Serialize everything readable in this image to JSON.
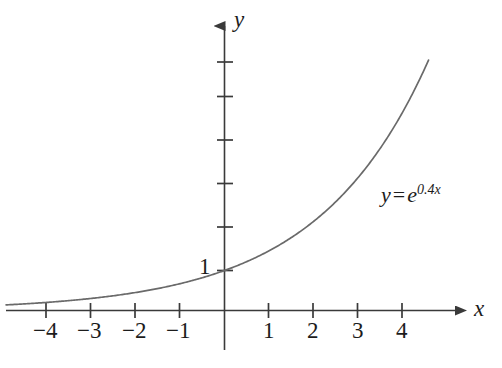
{
  "figure": {
    "background_color": "#ffffff",
    "axis_color": "#3a3a3a",
    "curve_color": "#6a6a6a",
    "text_color": "#1c1c1c"
  },
  "axes": {
    "x_axis_name": "x",
    "y_axis_name": "y",
    "y_axis_value_label": "1"
  },
  "equation": {
    "lhs": "y",
    "operator": "=",
    "base": "e",
    "exponent": "0.4x",
    "full_text": "y = e^(0.4x)"
  },
  "chart_data": {
    "type": "line",
    "title": "",
    "subtitle": "",
    "xlabel": "x",
    "ylabel": "y",
    "function": "y = e^(0.4x)",
    "legend": [
      "y = e^{0.4x}"
    ],
    "legend_position": "inline-right",
    "grid": false,
    "xlim": [
      -5.0,
      5.1
    ],
    "ylim": [
      -1.0,
      6.5
    ],
    "x_ticks": [
      -4,
      -3,
      -2,
      -1,
      1,
      2,
      3,
      4
    ],
    "x_tick_labels": [
      "−4",
      "−3",
      "−2",
      "−1",
      "1",
      "2",
      "3",
      "4"
    ],
    "y_ticks": [
      1,
      2,
      3,
      4,
      5,
      6
    ],
    "y_tick_labels": [
      "1",
      "",
      "",
      "",
      "",
      ""
    ],
    "y_intercept": 1,
    "x": [
      -5,
      -4.5,
      -4,
      -3.5,
      -3,
      -2.5,
      -2,
      -1.5,
      -1,
      -0.5,
      0,
      0.5,
      1,
      1.5,
      2,
      2.5,
      3,
      3.5,
      4,
      4.5,
      4.8
    ],
    "y": [
      0.135,
      0.165,
      0.202,
      0.247,
      0.301,
      0.368,
      0.449,
      0.549,
      0.67,
      0.819,
      1.0,
      1.221,
      1.492,
      1.822,
      2.226,
      2.718,
      3.32,
      4.055,
      4.953,
      6.05,
      6.82
    ],
    "series": [
      {
        "name": "y = e^{0.4x}",
        "values": [
          0.135,
          0.165,
          0.202,
          0.247,
          0.301,
          0.368,
          0.449,
          0.549,
          0.67,
          0.819,
          1.0,
          1.221,
          1.492,
          1.822,
          2.226,
          2.718,
          3.32,
          4.055,
          4.953,
          6.05,
          6.82
        ]
      }
    ],
    "annotations": [
      {
        "text": "y = e^{0.4x}",
        "x": 3.55,
        "y": 2.8
      },
      {
        "text": "1",
        "x": -0.35,
        "y": 1.25
      }
    ]
  }
}
